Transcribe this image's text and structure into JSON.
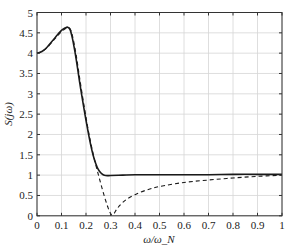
{
  "chart_data": {
    "type": "line",
    "title": "",
    "xlabel": "ω/ω_N",
    "ylabel": "S(jω)",
    "xlim": [
      0,
      1
    ],
    "ylim": [
      0,
      5
    ],
    "grid": true,
    "legend": null,
    "xticks": [
      0,
      0.1,
      0.2,
      0.3,
      0.4,
      0.5,
      0.6,
      0.7,
      0.8,
      0.9,
      1
    ],
    "xtick_labels": [
      "0",
      "0.1",
      "0.2",
      "0.3",
      "0.4",
      "0.5",
      "0.6",
      "0.7",
      "0.8",
      "0.9",
      "1"
    ],
    "yticks": [
      0,
      0.5,
      1,
      1.5,
      2,
      2.5,
      3,
      3.5,
      4,
      4.5,
      5
    ],
    "ytick_labels": [
      "0",
      "0.5",
      "1",
      "1.5",
      "2",
      "2.5",
      "3",
      "3.5",
      "4",
      "4.5",
      "5"
    ],
    "series": [
      {
        "name": "solid",
        "style": "solid",
        "color": "#1a1a1a",
        "x": [
          0,
          0.02,
          0.04,
          0.06,
          0.08,
          0.1,
          0.115,
          0.125,
          0.135,
          0.145,
          0.16,
          0.175,
          0.19,
          0.2,
          0.21,
          0.22,
          0.23,
          0.24,
          0.25,
          0.26,
          0.27,
          0.28,
          0.3,
          0.35,
          0.4,
          0.5,
          0.6,
          0.7,
          0.8,
          0.9,
          1.0
        ],
        "y": [
          4.0,
          4.04,
          4.14,
          4.28,
          4.43,
          4.56,
          4.62,
          4.64,
          4.58,
          4.35,
          3.85,
          3.25,
          2.7,
          2.35,
          2.02,
          1.72,
          1.47,
          1.28,
          1.14,
          1.06,
          1.01,
          0.99,
          0.99,
          1.0,
          1.01,
          1.01,
          1.01,
          1.01,
          1.02,
          1.02,
          1.02
        ]
      },
      {
        "name": "dashed",
        "style": "dashed",
        "color": "#1a1a1a",
        "x": [
          0,
          0.02,
          0.04,
          0.06,
          0.08,
          0.1,
          0.115,
          0.125,
          0.135,
          0.145,
          0.16,
          0.175,
          0.19,
          0.2,
          0.21,
          0.22,
          0.23,
          0.24,
          0.25,
          0.26,
          0.27,
          0.28,
          0.29,
          0.3,
          0.31,
          0.33,
          0.36,
          0.4,
          0.45,
          0.5,
          0.6,
          0.7,
          0.8,
          0.9,
          1.0
        ],
        "y": [
          4.0,
          4.04,
          4.13,
          4.26,
          4.4,
          4.53,
          4.6,
          4.62,
          4.6,
          4.42,
          3.95,
          3.35,
          2.78,
          2.42,
          2.08,
          1.78,
          1.5,
          1.25,
          1.02,
          0.8,
          0.58,
          0.38,
          0.2,
          0.06,
          0.02,
          0.2,
          0.38,
          0.52,
          0.64,
          0.72,
          0.82,
          0.88,
          0.93,
          0.97,
          1.0
        ]
      }
    ]
  }
}
